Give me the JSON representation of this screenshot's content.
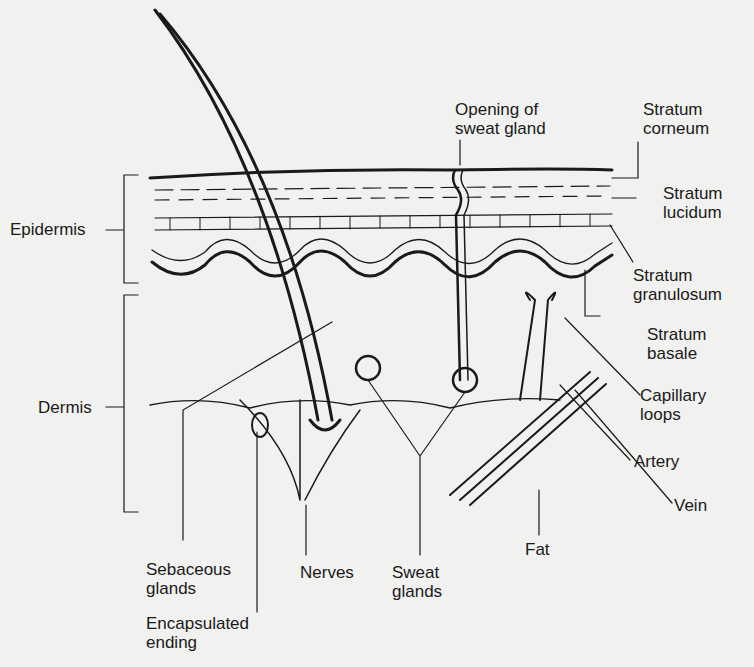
{
  "diagram": {
    "labels": {
      "opening_sweat_gland": "Opening of\nsweat gland",
      "stratum_corneum": "Stratum\ncorneum",
      "stratum_lucidum": "Stratum\nlucidum",
      "stratum_granulosum": "Stratum\ngranulosum",
      "stratum_basale": "Stratum\nbasale",
      "epidermis": "Epidermis",
      "dermis": "Dermis",
      "capillary_loops": "Capillary\nloops",
      "artery": "Artery",
      "vein": "Vein",
      "fat": "Fat",
      "sebaceous_glands": "Sebaceous\nglands",
      "encapsulated_ending": "Encapsulated\nending",
      "nerves": "Nerves",
      "sweat_glands": "Sweat\nglands"
    },
    "colors": {
      "ink": "#1a1a1a",
      "paper": "#f1f1ef"
    }
  }
}
